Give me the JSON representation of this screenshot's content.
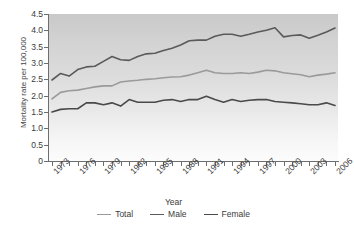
{
  "chart_data": {
    "type": "line",
    "title": "",
    "xlabel": "Year",
    "ylabel": "Mortality rate per 100,000",
    "xlim": [
      1973,
      2006
    ],
    "ylim": [
      0,
      4.5
    ],
    "ytick_labels": [
      "4.5",
      "4.0",
      "3.5",
      "3.0",
      "2.5",
      "2.0",
      "1.5",
      "1.0",
      "0.5",
      "0"
    ],
    "ytick_values": [
      4.5,
      4.0,
      3.5,
      3.0,
      2.5,
      2.0,
      1.5,
      1.0,
      0.5,
      0
    ],
    "x": [
      1973,
      1974,
      1975,
      1976,
      1977,
      1978,
      1979,
      1980,
      1981,
      1982,
      1983,
      1984,
      1985,
      1986,
      1987,
      1988,
      1989,
      1990,
      1991,
      1992,
      1993,
      1994,
      1995,
      1996,
      1997,
      1998,
      1999,
      2000,
      2001,
      2002,
      2003,
      2004,
      2005,
      2006
    ],
    "xtick_labels": [
      "1973",
      "1976",
      "1979",
      "1982",
      "1985",
      "1988",
      "1991",
      "1994",
      "1997",
      "2000",
      "2003",
      "2006"
    ],
    "grid": false,
    "legend_position": "bottom",
    "series": [
      {
        "name": "Total",
        "color": "#9a9a9a",
        "values": [
          1.9,
          2.1,
          2.15,
          2.17,
          2.22,
          2.27,
          2.3,
          2.3,
          2.42,
          2.45,
          2.47,
          2.5,
          2.52,
          2.55,
          2.57,
          2.58,
          2.63,
          2.7,
          2.78,
          2.7,
          2.68,
          2.68,
          2.7,
          2.68,
          2.72,
          2.78,
          2.76,
          2.7,
          2.67,
          2.64,
          2.58,
          2.63,
          2.66,
          2.7
        ]
      },
      {
        "name": "Male",
        "color": "#5a5a5a",
        "values": [
          2.48,
          2.68,
          2.6,
          2.8,
          2.88,
          2.9,
          3.05,
          3.2,
          3.1,
          3.08,
          3.2,
          3.28,
          3.3,
          3.38,
          3.45,
          3.55,
          3.68,
          3.7,
          3.7,
          3.82,
          3.88,
          3.88,
          3.82,
          3.88,
          3.95,
          4.0,
          4.08,
          3.8,
          3.84,
          3.86,
          3.76,
          3.85,
          3.95,
          4.07
        ]
      },
      {
        "name": "Female",
        "color": "#4a4a4a",
        "values": [
          1.5,
          1.58,
          1.6,
          1.6,
          1.78,
          1.78,
          1.72,
          1.78,
          1.68,
          1.88,
          1.8,
          1.8,
          1.8,
          1.86,
          1.88,
          1.82,
          1.88,
          1.88,
          1.98,
          1.88,
          1.8,
          1.88,
          1.82,
          1.86,
          1.88,
          1.88,
          1.82,
          1.8,
          1.78,
          1.75,
          1.72,
          1.72,
          1.78,
          1.7
        ]
      }
    ]
  },
  "legend": {
    "items": [
      {
        "label": "Total"
      },
      {
        "label": "Male"
      },
      {
        "label": "Female"
      }
    ]
  },
  "axes": {
    "x_title": "Year",
    "y_title": "Mortality rate per 100,000"
  }
}
